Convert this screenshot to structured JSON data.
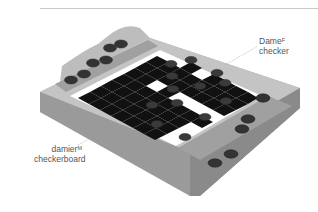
{
  "illustration": {
    "subject": "checkers game set",
    "colors": {
      "tray_wood": "#b3b3b3",
      "tray_edge": "#8c8c8c",
      "dark_square": "#111111",
      "light_square": "#ffffff",
      "piece": "#3a3a3a"
    }
  },
  "labels": {
    "checker": {
      "term": "Dame",
      "gender": "F",
      "translation": "checker"
    },
    "checkerboard": {
      "term": "damier",
      "gender": "M",
      "translation": "checkerboard"
    }
  }
}
